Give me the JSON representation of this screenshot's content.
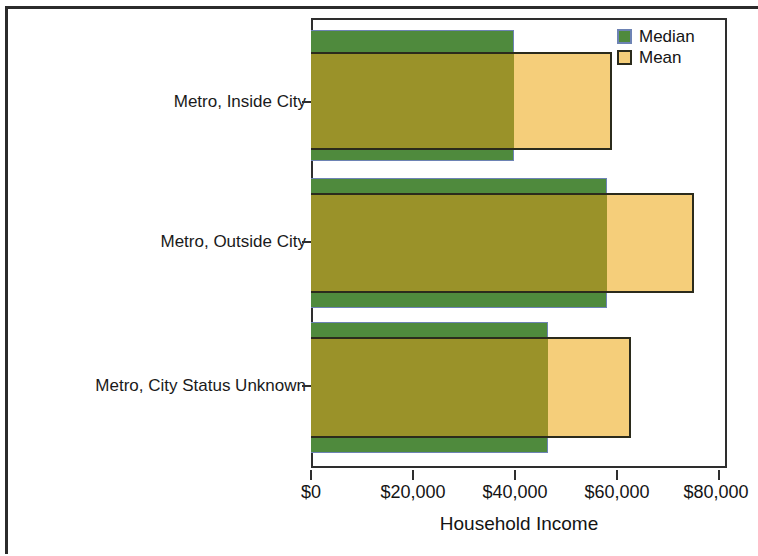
{
  "chart_data": {
    "type": "bar",
    "orientation": "horizontal",
    "title": "",
    "xlabel": "Household Income",
    "ylabel": "",
    "categories": [
      "Metro, Inside City",
      "Metro, Outside City",
      "Metro, City Status Unknown"
    ],
    "series": [
      {
        "name": "Median",
        "color": "#4F8A3D",
        "values": [
          41000,
          59700,
          47900
        ]
      },
      {
        "name": "Mean",
        "color": "#F5CE7A",
        "values": [
          60700,
          77400,
          64600
        ]
      }
    ],
    "xlim": [
      0,
      84000
    ],
    "xticks": [
      0,
      20000,
      40000,
      60000,
      80000
    ],
    "xtick_labels": [
      "$0",
      "$20,000",
      "$40,000",
      "$60,000",
      "$80,000"
    ],
    "grid": false,
    "legend_position": "top-right",
    "legend_entries": [
      "Median",
      "Mean"
    ]
  },
  "axis": {
    "x_title": "Household Income",
    "tick_labels": [
      "$0",
      "$20,000",
      "$40,000",
      "$60,000",
      "$80,000"
    ]
  },
  "legend": {
    "items": [
      {
        "label": "Median"
      },
      {
        "label": "Mean"
      }
    ]
  },
  "categories": [
    {
      "label": "Metro, Inside City"
    },
    {
      "label": "Metro, Outside City"
    },
    {
      "label": "Metro, City Status Unknown"
    }
  ]
}
